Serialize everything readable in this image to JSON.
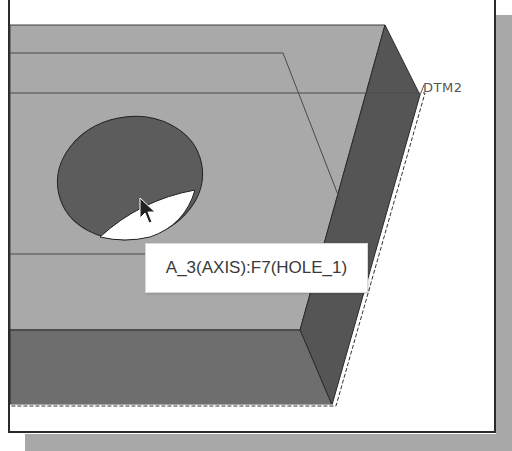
{
  "viewport": {
    "type": "3d-model-viewer",
    "colors": {
      "background": "#ffffff",
      "top_face": "#a9a9a9",
      "side_face": "#555555",
      "front_face": "#6e6e6e",
      "hole_inner": "#5c5c5c",
      "hole_highlight": "#ffffff",
      "edge_line": "#3c3c3c",
      "shadow": "#a8a8a8"
    }
  },
  "model": {
    "features": [
      {
        "name": "hole",
        "label": "HOLE_1",
        "feature_id": "F7"
      },
      {
        "name": "datum-plane",
        "label": "DTM2"
      }
    ]
  },
  "datum": {
    "label": "DTM2"
  },
  "tooltip": {
    "text": "A_3(AXIS):F7(HOLE_1)"
  },
  "cursor": {
    "icon": "arrow-pointer-icon"
  }
}
